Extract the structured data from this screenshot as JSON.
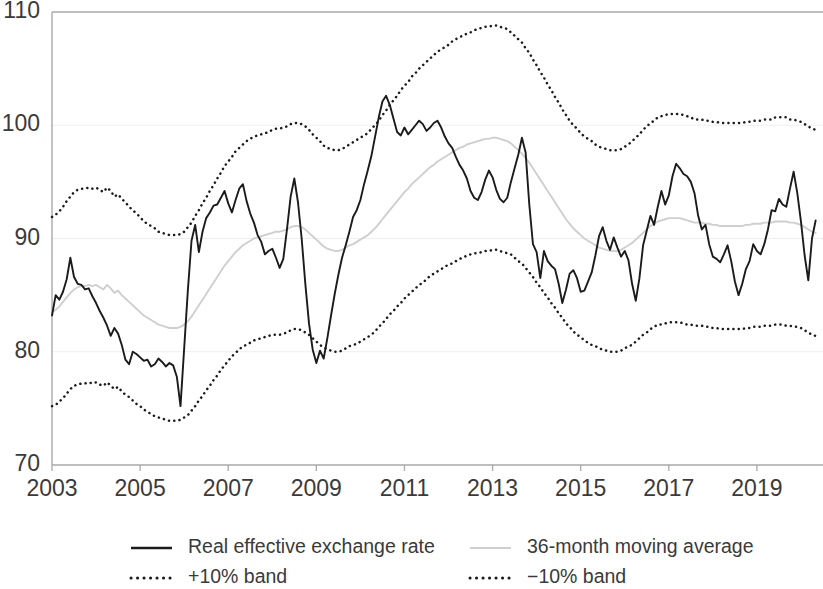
{
  "chart_data": {
    "type": "line",
    "title": "",
    "subtitle": "",
    "xlabel": "",
    "ylabel": "",
    "xlim": [
      2003.0,
      2020.5
    ],
    "ylim": [
      70,
      110
    ],
    "ytick_values": [
      70,
      80,
      90,
      100,
      110
    ],
    "ytick_labels": [
      "70",
      "80",
      "90",
      "100",
      "110"
    ],
    "xtick_values": [
      2003,
      2005,
      2007,
      2009,
      2011,
      2013,
      2015,
      2017,
      2019
    ],
    "xtick_labels": [
      "2003",
      "2005",
      "2007",
      "2009",
      "2011",
      "2013",
      "2015",
      "2017",
      "2019"
    ],
    "grid": "horizontal",
    "legend_position": "bottom",
    "x_start": 2003.0,
    "x_step": 0.0833333,
    "series": [
      {
        "name": "Real effective exchange rate",
        "style": "solid",
        "color": "#1b1b1b",
        "values": [
          83.2,
          85.0,
          84.6,
          85.3,
          86.4,
          88.3,
          86.6,
          86.0,
          85.9,
          85.5,
          85.6,
          84.9,
          84.3,
          83.6,
          83.0,
          82.3,
          81.4,
          82.1,
          81.6,
          80.6,
          79.3,
          78.9,
          80.0,
          79.8,
          79.5,
          79.2,
          79.3,
          78.7,
          78.9,
          79.4,
          79.1,
          78.7,
          79.0,
          78.8,
          77.8,
          75.2,
          80.3,
          85.4,
          89.8,
          91.2,
          88.8,
          90.6,
          91.8,
          92.3,
          92.9,
          93.0,
          93.6,
          94.2,
          93.1,
          92.3,
          93.4,
          94.4,
          94.8,
          93.3,
          92.2,
          91.4,
          90.3,
          89.7,
          88.6,
          88.9,
          89.1,
          88.3,
          87.4,
          88.2,
          90.8,
          93.7,
          95.3,
          93.2,
          90.0,
          86.0,
          82.5,
          80.2,
          79.0,
          80.1,
          79.4,
          81.2,
          83.2,
          85.1,
          86.8,
          88.3,
          89.4,
          90.6,
          91.9,
          92.5,
          93.4,
          94.8,
          96.0,
          97.3,
          99.0,
          100.7,
          102.1,
          102.6,
          101.8,
          100.6,
          99.4,
          99.1,
          99.8,
          99.2,
          99.6,
          100.0,
          100.4,
          100.1,
          99.5,
          99.8,
          100.2,
          100.4,
          99.8,
          99.0,
          98.4,
          98.0,
          97.2,
          96.5,
          96.0,
          95.3,
          94.2,
          93.6,
          93.4,
          94.1,
          95.2,
          96.0,
          95.4,
          94.3,
          93.5,
          93.2,
          93.6,
          95.0,
          96.2,
          97.4,
          98.9,
          97.6,
          93.0,
          89.5,
          88.8,
          86.5,
          88.9,
          88.0,
          87.6,
          87.3,
          86.0,
          84.3,
          85.5,
          86.9,
          87.2,
          86.5,
          85.3,
          85.4,
          86.2,
          87.0,
          88.5,
          90.2,
          91.0,
          89.8,
          89.0,
          90.1,
          89.2,
          88.4,
          88.9,
          88.1,
          86.0,
          84.5,
          86.5,
          89.4,
          90.7,
          92.0,
          91.2,
          92.8,
          94.2,
          93.0,
          93.8,
          95.5,
          96.6,
          96.2,
          95.7,
          95.5,
          95.0,
          94.0,
          92.0,
          90.8,
          91.2,
          89.5,
          88.4,
          88.2,
          87.9,
          88.6,
          89.4,
          88.0,
          86.2,
          85.0,
          86.0,
          87.3,
          88.0,
          89.5,
          88.9,
          88.6,
          89.5,
          90.8,
          92.5,
          92.4,
          93.5,
          93.0,
          92.8,
          94.4,
          95.9,
          94.0,
          91.5,
          88.5,
          86.3,
          90.0,
          91.6
        ]
      },
      {
        "name": "36-month moving average",
        "style": "solid-light",
        "color": "#cfcfcf",
        "values": [
          83.5,
          83.7,
          84.0,
          84.4,
          84.8,
          85.2,
          85.5,
          85.7,
          85.8,
          85.8,
          85.9,
          85.8,
          85.9,
          85.7,
          85.5,
          85.9,
          85.6,
          85.2,
          85.4,
          85.0,
          84.7,
          84.4,
          84.1,
          83.8,
          83.5,
          83.2,
          83.0,
          82.8,
          82.6,
          82.4,
          82.3,
          82.2,
          82.1,
          82.1,
          82.1,
          82.2,
          82.4,
          82.7,
          83.1,
          83.6,
          84.1,
          84.6,
          85.1,
          85.6,
          86.1,
          86.6,
          87.1,
          87.6,
          88.0,
          88.4,
          88.8,
          89.1,
          89.4,
          89.6,
          89.8,
          90.0,
          90.1,
          90.2,
          90.3,
          90.4,
          90.5,
          90.6,
          90.6,
          90.7,
          90.8,
          91.0,
          91.1,
          91.1,
          91.0,
          90.8,
          90.5,
          90.2,
          89.9,
          89.6,
          89.3,
          89.1,
          89.0,
          88.9,
          88.9,
          89.0,
          89.2,
          89.4,
          89.5,
          89.7,
          89.9,
          90.1,
          90.3,
          90.6,
          90.9,
          91.3,
          91.7,
          92.1,
          92.5,
          92.9,
          93.3,
          93.7,
          94.1,
          94.4,
          94.8,
          95.1,
          95.4,
          95.7,
          96.0,
          96.3,
          96.5,
          96.8,
          97.0,
          97.2,
          97.4,
          97.6,
          97.8,
          98.0,
          98.1,
          98.3,
          98.4,
          98.5,
          98.6,
          98.7,
          98.8,
          98.8,
          98.9,
          98.9,
          98.8,
          98.7,
          98.6,
          98.4,
          98.1,
          97.8,
          97.5,
          97.1,
          96.7,
          96.2,
          95.7,
          95.2,
          94.7,
          94.2,
          93.7,
          93.2,
          92.7,
          92.2,
          91.7,
          91.3,
          90.9,
          90.6,
          90.3,
          90.0,
          89.8,
          89.6,
          89.4,
          89.2,
          89.1,
          89.0,
          88.9,
          88.9,
          88.9,
          89.0,
          89.2,
          89.4,
          89.6,
          89.9,
          90.2,
          90.5,
          90.8,
          91.1,
          91.3,
          91.5,
          91.6,
          91.7,
          91.8,
          91.8,
          91.8,
          91.8,
          91.7,
          91.6,
          91.5,
          91.4,
          91.4,
          91.4,
          91.3,
          91.3,
          91.2,
          91.2,
          91.1,
          91.1,
          91.1,
          91.1,
          91.1,
          91.1,
          91.1,
          91.2,
          91.2,
          91.3,
          91.3,
          91.3,
          91.4,
          91.4,
          91.4,
          91.5,
          91.5,
          91.5,
          91.5,
          91.4,
          91.4,
          91.3,
          91.2,
          91.0,
          90.8,
          90.6,
          90.5
        ]
      },
      {
        "name": "+10% band",
        "style": "dotted",
        "color": "#1b1b1b",
        "values": [
          91.9,
          92.1,
          92.4,
          92.8,
          93.3,
          93.7,
          94.1,
          94.3,
          94.4,
          94.4,
          94.5,
          94.4,
          94.5,
          94.3,
          94.1,
          94.5,
          94.2,
          93.7,
          93.9,
          93.5,
          93.2,
          92.8,
          92.5,
          92.2,
          91.9,
          91.5,
          91.3,
          91.1,
          90.9,
          90.6,
          90.5,
          90.4,
          90.3,
          90.3,
          90.3,
          90.4,
          90.6,
          91.0,
          91.4,
          92.0,
          92.5,
          93.1,
          93.6,
          94.2,
          94.7,
          95.3,
          95.8,
          96.4,
          96.8,
          97.2,
          97.7,
          98.0,
          98.3,
          98.6,
          98.8,
          99.0,
          99.1,
          99.2,
          99.3,
          99.4,
          99.6,
          99.7,
          99.7,
          99.8,
          99.9,
          100.1,
          100.2,
          100.2,
          100.1,
          99.9,
          99.6,
          99.2,
          98.9,
          98.6,
          98.2,
          98.0,
          97.9,
          97.8,
          97.8,
          97.9,
          98.1,
          98.3,
          98.5,
          98.7,
          98.9,
          99.1,
          99.3,
          99.7,
          100.0,
          100.4,
          100.9,
          101.3,
          101.8,
          102.2,
          102.6,
          103.1,
          103.5,
          103.8,
          104.3,
          104.6,
          105.0,
          105.3,
          105.6,
          105.9,
          106.2,
          106.5,
          106.7,
          106.9,
          107.1,
          107.4,
          107.6,
          107.8,
          107.9,
          108.1,
          108.2,
          108.4,
          108.5,
          108.6,
          108.7,
          108.7,
          108.8,
          108.8,
          108.7,
          108.6,
          108.5,
          108.2,
          107.9,
          107.6,
          107.3,
          106.8,
          106.4,
          105.8,
          105.3,
          104.7,
          104.2,
          103.6,
          103.1,
          102.5,
          102.0,
          101.4,
          100.9,
          100.4,
          100.0,
          99.7,
          99.3,
          99.0,
          98.8,
          98.6,
          98.3,
          98.1,
          98.0,
          97.9,
          97.8,
          97.8,
          97.8,
          97.9,
          98.1,
          98.3,
          98.6,
          98.9,
          99.2,
          99.6,
          99.9,
          100.2,
          100.4,
          100.7,
          100.8,
          100.9,
          101.0,
          101.0,
          101.0,
          101.0,
          100.9,
          100.8,
          100.7,
          100.5,
          100.5,
          100.5,
          100.4,
          100.4,
          100.3,
          100.3,
          100.2,
          100.2,
          100.2,
          100.2,
          100.2,
          100.2,
          100.2,
          100.3,
          100.3,
          100.4,
          100.4,
          100.4,
          100.5,
          100.5,
          100.5,
          100.7,
          100.7,
          100.7,
          100.7,
          100.5,
          100.5,
          100.4,
          100.3,
          100.1,
          99.9,
          99.7,
          99.6
        ]
      },
      {
        "name": "−10% band",
        "style": "dotted",
        "color": "#1b1b1b",
        "values": [
          75.2,
          75.3,
          75.6,
          75.9,
          76.3,
          76.7,
          77.0,
          77.1,
          77.2,
          77.2,
          77.3,
          77.2,
          77.3,
          77.1,
          77.0,
          77.3,
          77.0,
          76.7,
          76.9,
          76.5,
          76.2,
          76.0,
          75.7,
          75.4,
          75.2,
          74.9,
          74.7,
          74.5,
          74.3,
          74.2,
          74.1,
          74.0,
          73.9,
          73.9,
          73.9,
          74.0,
          74.2,
          74.4,
          74.8,
          75.2,
          75.7,
          76.1,
          76.6,
          77.0,
          77.5,
          77.9,
          78.4,
          78.8,
          79.2,
          79.6,
          79.9,
          80.2,
          80.5,
          80.6,
          80.8,
          81.0,
          81.1,
          81.2,
          81.3,
          81.4,
          81.5,
          81.5,
          81.5,
          81.6,
          81.7,
          81.9,
          82.0,
          82.0,
          81.9,
          81.7,
          81.5,
          81.2,
          80.9,
          80.6,
          80.4,
          80.2,
          80.1,
          80.0,
          80.0,
          80.1,
          80.3,
          80.5,
          80.6,
          80.7,
          80.9,
          81.1,
          81.3,
          81.5,
          81.8,
          82.2,
          82.5,
          82.9,
          83.3,
          83.6,
          84.0,
          84.3,
          84.7,
          85.0,
          85.3,
          85.6,
          85.9,
          86.1,
          86.4,
          86.7,
          86.9,
          87.1,
          87.3,
          87.5,
          87.7,
          87.8,
          88.0,
          88.2,
          88.3,
          88.5,
          88.6,
          88.7,
          88.7,
          88.8,
          88.9,
          88.9,
          89.0,
          89.0,
          88.9,
          88.8,
          88.7,
          88.6,
          88.3,
          88.0,
          87.8,
          87.4,
          87.0,
          86.6,
          86.1,
          85.7,
          85.2,
          84.8,
          84.3,
          83.9,
          83.4,
          83.0,
          82.5,
          82.2,
          81.8,
          81.5,
          81.3,
          81.0,
          80.8,
          80.6,
          80.5,
          80.3,
          80.2,
          80.1,
          80.0,
          80.0,
          80.0,
          80.1,
          80.3,
          80.5,
          80.6,
          80.9,
          81.2,
          81.5,
          81.7,
          82.0,
          82.2,
          82.4,
          82.4,
          82.5,
          82.6,
          82.6,
          82.6,
          82.6,
          82.5,
          82.4,
          82.4,
          82.3,
          82.3,
          82.3,
          82.2,
          82.2,
          82.1,
          82.1,
          82.0,
          82.0,
          82.0,
          82.0,
          82.0,
          82.0,
          82.0,
          82.1,
          82.1,
          82.2,
          82.2,
          82.2,
          82.3,
          82.3,
          82.3,
          82.4,
          82.4,
          82.4,
          82.3,
          82.3,
          82.2,
          82.2,
          82.1,
          81.9,
          81.7,
          81.5,
          81.4
        ]
      }
    ]
  },
  "legend": {
    "items": [
      {
        "label": "Real effective exchange rate",
        "style": "solid"
      },
      {
        "label": "36-month moving average",
        "style": "solid-light"
      },
      {
        "label": "+10% band",
        "style": "dotted"
      },
      {
        "label": "−10% band",
        "style": "dotted"
      }
    ]
  },
  "colors": {
    "reer": "#1b1b1b",
    "moving_average": "#cfcfcf",
    "band": "#1b1b1b",
    "axis": "#a9a9a9",
    "grid": "#eeeeee",
    "text": "#3a3a3a"
  }
}
